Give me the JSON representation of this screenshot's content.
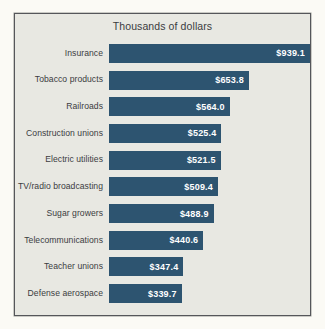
{
  "chart_data": {
    "type": "bar",
    "orientation": "horizontal",
    "title": "Thousands of dollars",
    "xlabel": "",
    "ylabel": "",
    "grid": false,
    "legend": null,
    "xlim": [
      0,
      939.1
    ],
    "value_prefix": "$",
    "categories": [
      "Insurance",
      "Tobacco products",
      "Railroads",
      "Construction unions",
      "Electric utilities",
      "TV/radio broadcasting",
      "Sugar growers",
      "Telecommunications",
      "Teacher unions",
      "Defense aerospace"
    ],
    "values": [
      939.1,
      653.8,
      564.0,
      525.4,
      521.5,
      509.4,
      488.9,
      440.6,
      347.4,
      339.7
    ],
    "value_labels": [
      "$939.1",
      "$653.8",
      "$564.0",
      "$525.4",
      "$521.5",
      "$509.4",
      "$488.9",
      "$440.6",
      "$347.4",
      "$339.7"
    ],
    "bars": [
      {
        "category": "Insurance",
        "value": 939.1,
        "label": "$939.1"
      },
      {
        "category": "Tobacco products",
        "value": 653.8,
        "label": "$653.8"
      },
      {
        "category": "Railroads",
        "value": 564.0,
        "label": "$564.0"
      },
      {
        "category": "Construction unions",
        "value": 525.4,
        "label": "$525.4"
      },
      {
        "category": "Electric utilities",
        "value": 521.5,
        "label": "$521.5"
      },
      {
        "category": "TV/radio broadcasting",
        "value": 509.4,
        "label": "$509.4"
      },
      {
        "category": "Sugar growers",
        "value": 488.9,
        "label": "$488.9"
      },
      {
        "category": "Telecommunications",
        "value": 440.6,
        "label": "$440.6"
      },
      {
        "category": "Teacher unions",
        "value": 347.4,
        "label": "$347.4"
      },
      {
        "category": "Defense aerospace",
        "value": 339.7,
        "label": "$339.7"
      }
    ],
    "colors": {
      "bar": "#2d5470",
      "value_text": "#ffffff",
      "category_text": "#3b3c3f",
      "title_text": "#3b3c3f",
      "plot_background": "#e8e8e2",
      "page_background": "#fbfaf5",
      "frame_border": "#55565a"
    }
  }
}
